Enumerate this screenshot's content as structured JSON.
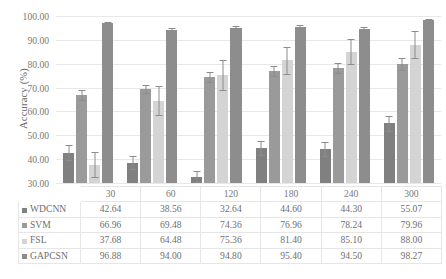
{
  "chart_data": {
    "type": "bar",
    "title": "",
    "xlabel": "",
    "ylabel": "Accuracy (%)",
    "ylim": [
      30.0,
      100.0
    ],
    "yticks": [
      "30.00",
      "40.00",
      "50.00",
      "60.00",
      "70.00",
      "80.00",
      "90.00",
      "100.00"
    ],
    "grid": true,
    "legend_position": "table-below",
    "categories": [
      "30",
      "60",
      "120",
      "180",
      "240",
      "300"
    ],
    "series": [
      {
        "name": "WDCNN",
        "color": "#808080",
        "values": [
          42.64,
          38.56,
          32.64,
          44.6,
          44.3,
          55.07
        ],
        "errors": [
          3.2,
          2.6,
          2.2,
          3.0,
          3.0,
          3.2
        ],
        "display": [
          "42.64",
          "38.56",
          "32.64",
          "44.60",
          "44.30",
          "55.07"
        ]
      },
      {
        "name": "SVM",
        "color": "#9a9a9a",
        "values": [
          66.96,
          69.48,
          74.36,
          76.96,
          78.24,
          79.96
        ],
        "errors": [
          2.2,
          1.8,
          2.2,
          2.2,
          2.2,
          2.4
        ],
        "display": [
          "66.96",
          "69.48",
          "74.36",
          "76.96",
          "78.24",
          "79.96"
        ]
      },
      {
        "name": "FSL",
        "color": "#d4d4d4",
        "values": [
          37.68,
          64.48,
          75.36,
          81.4,
          85.1,
          88.0
        ],
        "errors": [
          5.2,
          6.0,
          6.4,
          5.6,
          5.4,
          5.6
        ],
        "display": [
          "37.68",
          "64.48",
          "75.36",
          "81.40",
          "85.10",
          "88.00"
        ]
      },
      {
        "name": "GAPCSN",
        "color": "#8d8d8d",
        "values": [
          96.88,
          94.0,
          94.8,
          95.4,
          94.5,
          98.27
        ],
        "errors": [
          0.8,
          0.9,
          0.8,
          0.8,
          0.9,
          0.6
        ],
        "display": [
          "96.88",
          "94.00",
          "94.80",
          "95.40",
          "94.50",
          "98.27"
        ]
      }
    ]
  }
}
